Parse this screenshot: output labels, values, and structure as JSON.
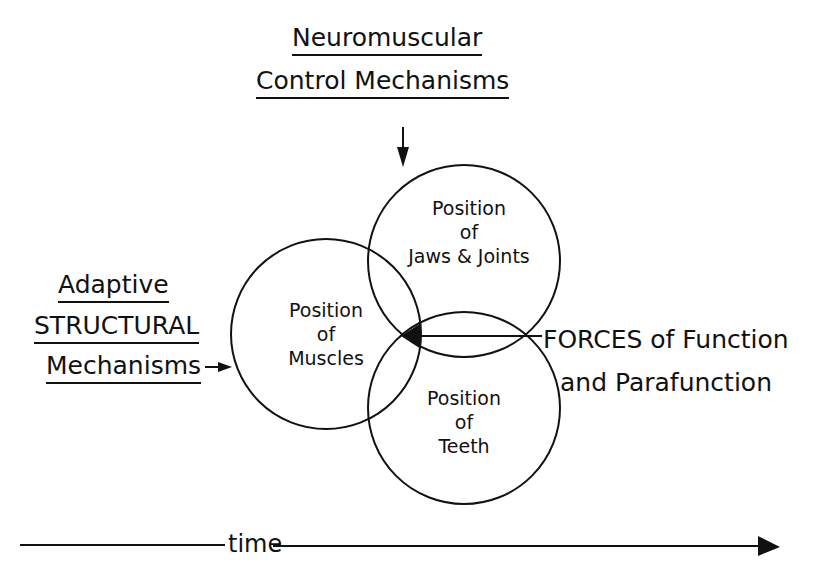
{
  "diagram": {
    "top_label": {
      "line1": "Neuromuscular",
      "line2": "Control Mechanisms"
    },
    "left_label": {
      "line1": "Adaptive",
      "line2": "STRUCTURAL",
      "line3": "Mechanisms"
    },
    "right_label": {
      "line1": "FORCES of Function",
      "line2": "and Parafunction"
    },
    "circles": [
      {
        "id": "muscles",
        "line1": "Position",
        "line2": "of",
        "line3": "Muscles"
      },
      {
        "id": "jaws",
        "line1": "Position",
        "line2": "of",
        "line3": "Jaws & Joints"
      },
      {
        "id": "teeth",
        "line1": "Position",
        "line2": "of",
        "line3": "Teeth"
      }
    ],
    "time_axis": {
      "label": "time"
    },
    "colors": {
      "ink": "#111111",
      "background": "#ffffff"
    }
  }
}
